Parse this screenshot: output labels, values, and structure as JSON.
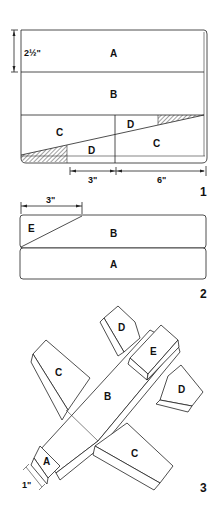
{
  "figures": [
    {
      "number": "1",
      "description": "Board layout with cut lines",
      "parts": [
        "A",
        "B",
        "C",
        "D",
        "D",
        "C"
      ],
      "dimensions": {
        "height_a": "2½\"",
        "left_segment": "3\"",
        "right_segment": "6\""
      }
    },
    {
      "number": "2",
      "description": "Stacked pieces B over A with E cut",
      "parts": [
        "E",
        "B",
        "A"
      ],
      "dimensions": {
        "e_width": "3\""
      }
    },
    {
      "number": "3",
      "description": "Assembled airplane",
      "parts": [
        "D",
        "E",
        "C",
        "B",
        "D",
        "A",
        "C"
      ],
      "dimensions": {
        "nose": "1\""
      }
    }
  ],
  "colors": {
    "line": "#222222",
    "hatch": "#888888",
    "background": "#ffffff"
  }
}
